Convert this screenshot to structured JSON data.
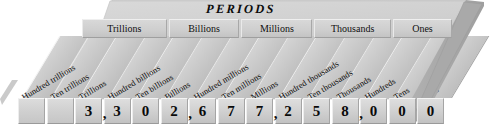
{
  "title": "PERIODS",
  "diagram": {
    "type": "place-value-chart",
    "number": "3,302,677,258,000",
    "accent_color": "#c9c9c9",
    "text_color": "#0a0a0a"
  },
  "periods": [
    {
      "label": "Trillions"
    },
    {
      "label": "Billions"
    },
    {
      "label": "Millions"
    },
    {
      "label": "Thousands"
    },
    {
      "label": "Ones"
    }
  ],
  "places": [
    {
      "label": "Hundred trillions",
      "digit": "3"
    },
    {
      "label": "Ten trillions",
      "digit": "3"
    },
    {
      "label": "Trillions",
      "digit": "0"
    },
    {
      "label": "Hundred billions",
      "digit": "2"
    },
    {
      "label": "Ten billions",
      "digit": "6"
    },
    {
      "label": "Billions",
      "digit": "7"
    },
    {
      "label": "Hundred millions",
      "digit": "7"
    },
    {
      "label": "Ten millions",
      "digit": "2"
    },
    {
      "label": "Millions",
      "digit": "5"
    },
    {
      "label": "Hundred thousands",
      "digit": "8"
    },
    {
      "label": "Ten thousands",
      "digit": "0"
    },
    {
      "label": "Thousands",
      "digit": "0"
    },
    {
      "label": "Hundreds",
      "digit": "0"
    },
    {
      "label": "Tens",
      "digit": ""
    },
    {
      "label": "Ones",
      "digit": ""
    }
  ],
  "digit_cells": [
    {
      "value": "",
      "comma": ""
    },
    {
      "value": "",
      "comma": ""
    },
    {
      "value": "3",
      "comma": ","
    },
    {
      "value": "3",
      "comma": ""
    },
    {
      "value": "0",
      "comma": ""
    },
    {
      "value": "2",
      "comma": ","
    },
    {
      "value": "6",
      "comma": ""
    },
    {
      "value": "7",
      "comma": ""
    },
    {
      "value": "7",
      "comma": ","
    },
    {
      "value": "2",
      "comma": ""
    },
    {
      "value": "5",
      "comma": ""
    },
    {
      "value": "8",
      "comma": ","
    },
    {
      "value": "0",
      "comma": ""
    },
    {
      "value": "0",
      "comma": ""
    },
    {
      "value": "0",
      "comma": ""
    }
  ]
}
